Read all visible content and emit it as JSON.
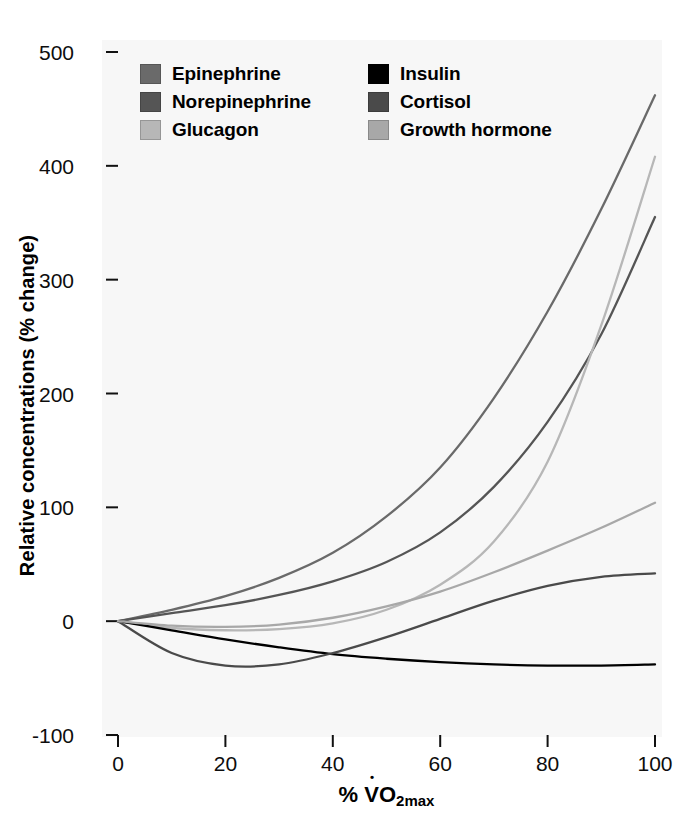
{
  "chart_data": {
    "type": "line",
    "title": "",
    "xlabel": "% VO2max",
    "ylabel": "Relative concentrations (% change)",
    "xlim": [
      0,
      100
    ],
    "ylim": [
      -100,
      500
    ],
    "grid": false,
    "legend_position": "top-inside",
    "x_ticks": [
      "0",
      "20",
      "40",
      "60",
      "80",
      "100"
    ],
    "x_tick_values": [
      0,
      20,
      40,
      60,
      80,
      100
    ],
    "y_ticks": [
      "500",
      "400",
      "300",
      "200",
      "100",
      "0",
      "-100"
    ],
    "y_tick_values": [
      500,
      400,
      300,
      200,
      100,
      0,
      -100
    ],
    "x": [
      0,
      10,
      20,
      30,
      40,
      50,
      60,
      70,
      80,
      90,
      100
    ],
    "series": [
      {
        "name": "Epinephrine",
        "color": "#6a6a6a",
        "values": [
          0,
          10,
          22,
          38,
          60,
          92,
          135,
          196,
          272,
          362,
          462
        ]
      },
      {
        "name": "Norepinephrine",
        "color": "#555555",
        "values": [
          0,
          7,
          14,
          23,
          35,
          52,
          78,
          118,
          175,
          252,
          355
        ]
      },
      {
        "name": "Glucagon",
        "color": "#b7b7b7",
        "values": [
          0,
          -6,
          -8,
          -7,
          -2,
          10,
          32,
          70,
          140,
          260,
          408
        ]
      },
      {
        "name": "Insulin",
        "color": "#000000",
        "values": [
          0,
          -8,
          -16,
          -23,
          -29,
          -33,
          -36,
          -38,
          -39,
          -39,
          -38
        ]
      },
      {
        "name": "Cortisol",
        "color": "#4a4a4a",
        "values": [
          0,
          -28,
          -39,
          -38,
          -28,
          -14,
          2,
          18,
          31,
          39,
          42
        ]
      },
      {
        "name": "Growth hormone",
        "color": "#a8a8a8",
        "values": [
          0,
          -4,
          -5,
          -3,
          3,
          13,
          26,
          43,
          62,
          82,
          104
        ]
      }
    ]
  },
  "legend": {
    "items": [
      {
        "label": "Epinephrine",
        "color": "#6a6a6a"
      },
      {
        "label": "Insulin",
        "color": "#000000"
      },
      {
        "label": "Norepinephrine",
        "color": "#555555"
      },
      {
        "label": "Cortisol",
        "color": "#4a4a4a"
      },
      {
        "label": "Glucagon",
        "color": "#b7b7b7"
      },
      {
        "label": "Growth hormone",
        "color": "#a8a8a8"
      }
    ]
  },
  "axes": {
    "y_title": "Relative concentrations (% change)",
    "x_title_prefix": "%",
    "x_title_v": "V",
    "x_title_o": "O",
    "x_title_sub": "2max"
  }
}
